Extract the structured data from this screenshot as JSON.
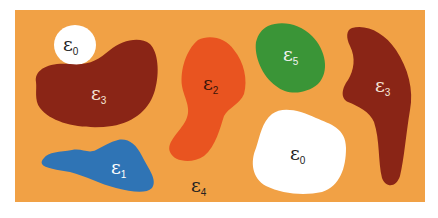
{
  "diagram": {
    "colors": {
      "background": "#f1a145",
      "white": "#ffffff",
      "brown": "#8a2516",
      "red_orange": "#e95420",
      "green": "#3a9537",
      "blue": "#2f74b5"
    },
    "regions": [
      {
        "id": "white-circle",
        "symbol": "ε",
        "subscript": "0",
        "color": "white",
        "label_color": "#222222"
      },
      {
        "id": "brown-left",
        "symbol": "ε",
        "subscript": "3",
        "color": "brown",
        "label_color": "#f5e6d8"
      },
      {
        "id": "red-orange",
        "symbol": "ε",
        "subscript": "2",
        "color": "red_orange",
        "label_color": "#3a1408"
      },
      {
        "id": "green",
        "symbol": "ε",
        "subscript": "5",
        "color": "green",
        "label_color": "#f2f2f2"
      },
      {
        "id": "brown-right",
        "symbol": "ε",
        "subscript": "3",
        "color": "brown",
        "label_color": "#f5e6d8"
      },
      {
        "id": "blue",
        "symbol": "ε",
        "subscript": "1",
        "color": "blue",
        "label_color": "#ffffff"
      },
      {
        "id": "white-blob",
        "symbol": "ε",
        "subscript": "0",
        "color": "white",
        "label_color": "#222222"
      },
      {
        "id": "background",
        "symbol": "ε",
        "subscript": "4",
        "color": "background",
        "label_color": "#222222"
      }
    ]
  }
}
